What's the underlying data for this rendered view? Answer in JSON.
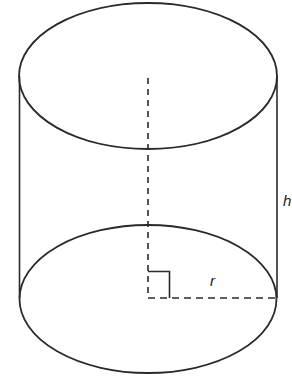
{
  "diagram": {
    "type": "cylinder",
    "colors": {
      "stroke": "#2a2a2a",
      "background": "#ffffff"
    },
    "labels": {
      "height": "h",
      "radius": "r"
    },
    "annotations": {
      "right_angle_marker": true,
      "center_axis": "dashed",
      "radius_line": "dashed"
    }
  }
}
